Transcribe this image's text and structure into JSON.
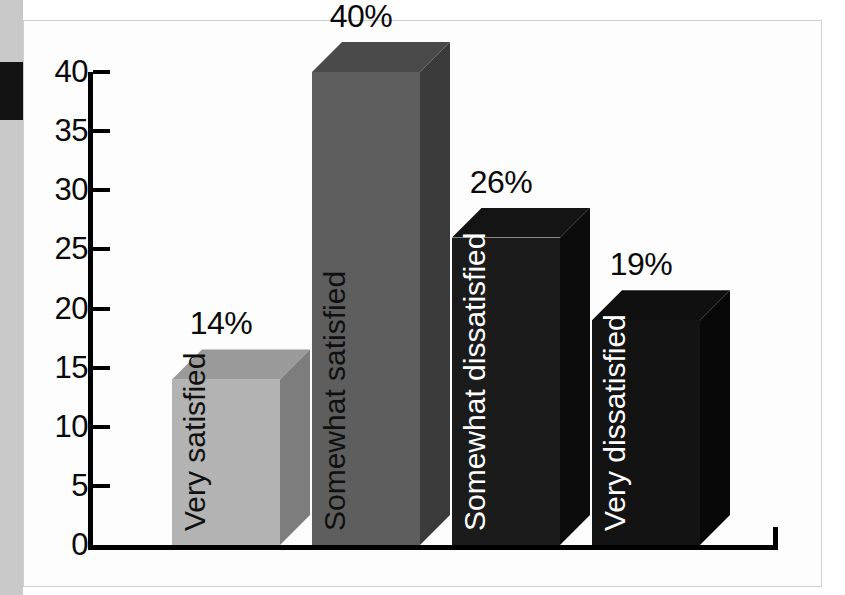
{
  "figure": {
    "background_color": "#ffffff",
    "frame_color": "#cfcfcf",
    "scan_strip_color": "#c9c9c9",
    "scan_block_color": "#131313"
  },
  "chart_data": {
    "type": "bar",
    "title": "",
    "subtitle": "",
    "xlabel": "",
    "ylabel": "",
    "categories": [
      "Very satisfied",
      "Somewhat satisfied",
      "Somewhat dissatisfied",
      "Very dissatisfied"
    ],
    "values": [
      14,
      40,
      26,
      19
    ],
    "data_labels": [
      "14%",
      "40%",
      "26%",
      "19%"
    ],
    "ylim": [
      0,
      40
    ],
    "yticks": [
      0,
      5,
      10,
      15,
      20,
      25,
      30,
      35,
      40
    ],
    "ytick_labels": [
      "0",
      "5",
      "10",
      "15",
      "20",
      "25",
      "30",
      "35",
      "40"
    ],
    "grid": false,
    "legend": false,
    "legend_position": "none",
    "style": "3d-isometric",
    "bar_colors": [
      "#b3b3b3",
      "#5e5e5e",
      "#1b1b1b",
      "#131313"
    ],
    "bar_side_colors": [
      "#7d7d7d",
      "#3b3b3b",
      "#0c0c0c",
      "#080808"
    ],
    "bar_top_colors": [
      "#9a9a9a",
      "#4a4a4a",
      "#141414",
      "#0f0f0f"
    ],
    "bar_label_colors": [
      "#101010",
      "#101010",
      "#ffffff",
      "#ffffff"
    ],
    "axis_color": "#000000"
  }
}
